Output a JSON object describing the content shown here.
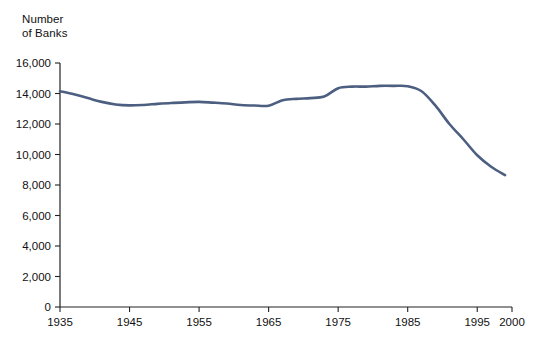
{
  "chart_data": {
    "type": "line",
    "title": "",
    "subtitle": "",
    "ylabel": "Number\nof Banks",
    "xlabel": "",
    "ylim": [
      0,
      16000
    ],
    "xlim": [
      1935,
      2000
    ],
    "grid": false,
    "legend": "none",
    "line_color": "#4d5f80",
    "axis_color": "#222222",
    "y_ticks": [
      0,
      2000,
      4000,
      6000,
      8000,
      10000,
      12000,
      14000,
      16000
    ],
    "y_tick_labels": [
      "0",
      "2,000",
      "4,000",
      "6,000",
      "8,000",
      "10,000",
      "12,000",
      "14,000",
      "16,000"
    ],
    "x_ticks": [
      1935,
      1945,
      1955,
      1965,
      1975,
      1985,
      1995,
      2000
    ],
    "x_tick_labels": [
      "1935",
      "1945",
      "1955",
      "1965",
      "1975",
      "1985",
      "1995",
      "2000"
    ],
    "series": [
      {
        "name": "Number of Banks",
        "x": [
          1935,
          1937,
          1939,
          1941,
          1943,
          1945,
          1947,
          1949,
          1951,
          1953,
          1955,
          1957,
          1959,
          1961,
          1963,
          1965,
          1967,
          1969,
          1971,
          1973,
          1975,
          1977,
          1979,
          1981,
          1983,
          1985,
          1987,
          1989,
          1991,
          1993,
          1995,
          1997,
          1999
        ],
        "values": [
          14150,
          13950,
          13700,
          13450,
          13280,
          13220,
          13250,
          13320,
          13380,
          13420,
          13450,
          13400,
          13340,
          13250,
          13210,
          13200,
          13550,
          13650,
          13700,
          13800,
          14350,
          14450,
          14450,
          14500,
          14500,
          14480,
          14150,
          13200,
          12000,
          11000,
          9950,
          9200,
          8650
        ]
      }
    ]
  }
}
